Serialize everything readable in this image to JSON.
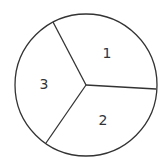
{
  "diagram": {
    "type": "circle divided into three sectors (spinner)",
    "stroke_color": "#333333",
    "background": "#ffffff",
    "center": [
      86,
      85
    ],
    "radius": 71,
    "divider_endpoints": [
      [
        53,
        22
      ],
      [
        156,
        89
      ],
      [
        46,
        143
      ]
    ],
    "sectors": [
      {
        "label": "1",
        "position": [
          107,
          58
        ]
      },
      {
        "label": "2",
        "position": [
          103,
          125
        ]
      },
      {
        "label": "3",
        "position": [
          44,
          89
        ]
      }
    ]
  }
}
